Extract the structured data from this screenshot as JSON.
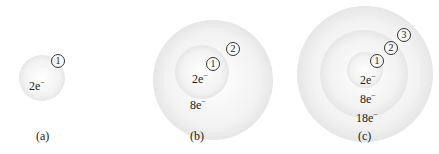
{
  "figures": [
    {
      "caption": "(a)",
      "shells": [
        {
          "number": "1",
          "electrons": "2e",
          "charge": "−"
        }
      ]
    },
    {
      "caption": "(b)",
      "shells": [
        {
          "number": "1",
          "electrons": "2e",
          "charge": "−"
        },
        {
          "number": "2",
          "electrons": "8e",
          "charge": "−"
        }
      ]
    },
    {
      "caption": "(c)",
      "shells": [
        {
          "number": "1",
          "electrons": "2e",
          "charge": "−"
        },
        {
          "number": "2",
          "electrons": "8e",
          "charge": "−"
        },
        {
          "number": "3",
          "electrons": "18e",
          "charge": "−"
        }
      ]
    }
  ]
}
